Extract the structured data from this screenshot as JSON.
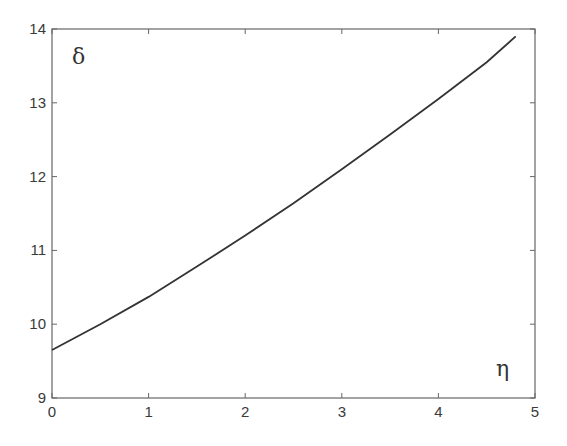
{
  "chart_data": {
    "type": "line",
    "title": "",
    "xlabel": "η",
    "ylabel": "δ",
    "xlim": [
      0,
      5
    ],
    "ylim": [
      9,
      14
    ],
    "xticks": [
      0,
      1,
      2,
      3,
      4,
      5
    ],
    "yticks": [
      9,
      10,
      11,
      12,
      13,
      14
    ],
    "grid": false,
    "legend": null,
    "series": [
      {
        "name": "δ(η)",
        "x": [
          0,
          0.5,
          1,
          1.5,
          2,
          2.5,
          3,
          3.5,
          4,
          4.5,
          4.8
        ],
        "y": [
          9.65,
          10.0,
          10.37,
          10.78,
          11.2,
          11.64,
          12.1,
          12.57,
          13.05,
          13.55,
          13.9
        ]
      }
    ]
  },
  "labels": {
    "x_axis": "η",
    "y_axis": "δ",
    "xtick_labels": [
      "0",
      "1",
      "2",
      "3",
      "4",
      "5"
    ],
    "ytick_labels": [
      "9",
      "10",
      "11",
      "12",
      "13",
      "14"
    ]
  },
  "colors": {
    "axis": "#555555",
    "line": "#333333",
    "background": "#ffffff"
  }
}
